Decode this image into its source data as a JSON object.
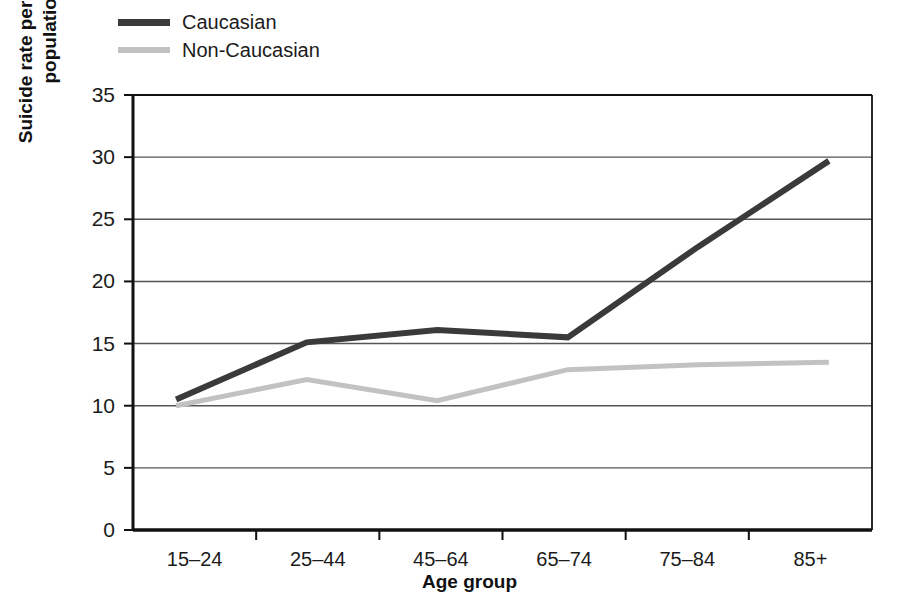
{
  "chart_data": {
    "type": "line",
    "title": "",
    "xlabel": "Age group",
    "ylabel": "Suicide rate per 100,000 population",
    "categories": [
      "15–24",
      "25–44",
      "45–64",
      "65–74",
      "75–84",
      "85+"
    ],
    "ylim": [
      0,
      35
    ],
    "yticks": [
      0,
      5,
      10,
      15,
      20,
      25,
      30,
      35
    ],
    "ytick_labels": [
      "0",
      "5",
      "10",
      "15",
      "20",
      "25",
      "30",
      "35"
    ],
    "grid": "horizontal",
    "legend_position": "top-left",
    "series": [
      {
        "name": "Caucasian",
        "color": "#3a3a3a",
        "values": [
          10.5,
          15.1,
          16.1,
          15.5,
          22.8,
          29.7
        ]
      },
      {
        "name": "Non-Caucasian",
        "color": "#c2c2c2",
        "values": [
          10.0,
          12.1,
          10.4,
          12.9,
          13.3,
          13.5
        ]
      }
    ]
  },
  "legend": {
    "items": [
      {
        "label": "Caucasian",
        "swatch": "caucasian"
      },
      {
        "label": "Non-Caucasian",
        "swatch": "noncaucasian"
      }
    ]
  },
  "axes": {
    "y_title": "Suicide rate per 100,000\npopulation",
    "x_title": "Age group"
  }
}
